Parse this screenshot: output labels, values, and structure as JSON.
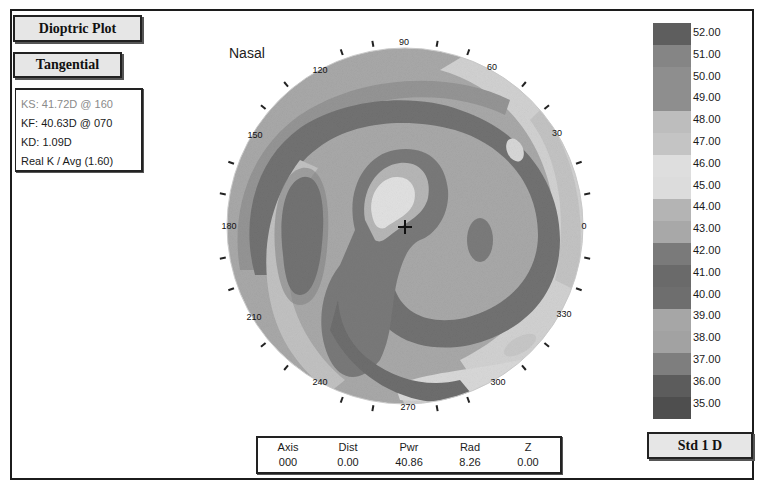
{
  "buttons": {
    "plot_type": "Dioptric Plot",
    "map_type": "Tangential",
    "scale": "Std 1 D"
  },
  "keratometry": {
    "ks": "KS: 41.72D @ 160",
    "kf": "KF: 40.63D @ 070",
    "kd": "KD:  1.09D",
    "real_k": "Real K / Avg (1.60)"
  },
  "orientation_label": "Nasal",
  "axis_labels": {
    "a90": "90",
    "a60": "60",
    "a30": "30",
    "a0": "0",
    "a330": "330",
    "a300": "300",
    "a270": "270",
    "a240": "240",
    "a210": "210",
    "a180": "180",
    "a150": "150",
    "a120": "120"
  },
  "legend": {
    "items": [
      {
        "value": "52.00",
        "color": "#5e5e5e"
      },
      {
        "value": "51.00",
        "color": "#858585"
      },
      {
        "value": "50.00",
        "color": "#8e8e8e"
      },
      {
        "value": "49.00",
        "color": "#8e8e8e"
      },
      {
        "value": "48.00",
        "color": "#bdbdbd"
      },
      {
        "value": "47.00",
        "color": "#c4c4c4"
      },
      {
        "value": "46.00",
        "color": "#dedede"
      },
      {
        "value": "45.00",
        "color": "#dcdcdc"
      },
      {
        "value": "44.00",
        "color": "#b4b4b4"
      },
      {
        "value": "43.00",
        "color": "#a8a8a8"
      },
      {
        "value": "42.00",
        "color": "#7a7a7a"
      },
      {
        "value": "41.00",
        "color": "#6a6a6a"
      },
      {
        "value": "40.00",
        "color": "#6e6e6e"
      },
      {
        "value": "39.00",
        "color": "#a6a6a6"
      },
      {
        "value": "38.00",
        "color": "#a2a2a2"
      },
      {
        "value": "37.00",
        "color": "#7e7e7e"
      },
      {
        "value": "36.00",
        "color": "#5c5c5c"
      },
      {
        "value": "35.00",
        "color": "#4e4e4e"
      }
    ]
  },
  "readout": {
    "headers": [
      "Axis",
      "Dist",
      "Pwr",
      "Rad",
      "Z"
    ],
    "values": [
      "000",
      "0.00",
      "40.86",
      "8.26",
      "0.00"
    ]
  }
}
